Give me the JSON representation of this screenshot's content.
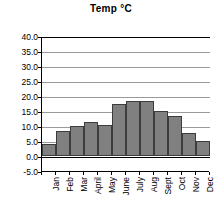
{
  "chart_data": {
    "type": "bar",
    "title": "Temp °C",
    "xlabel": "",
    "ylabel": "",
    "categories": [
      "Jan",
      "Feb",
      "Mar",
      "April",
      "May",
      "June",
      "July",
      "Aug",
      "Sept",
      "Oct",
      "Nov",
      "Dec"
    ],
    "values": [
      4.0,
      8.2,
      10.0,
      11.3,
      10.5,
      17.2,
      18.2,
      18.2,
      15.0,
      13.3,
      7.7,
      5.0
    ],
    "ylim": [
      -5.0,
      40.0
    ],
    "ytick_step": 5.0,
    "ytick_labels": [
      "40.0",
      "35.0",
      "30.0",
      "25.0",
      "20.0",
      "15.0",
      "10.0",
      "5.0",
      "0.0",
      "-5.0"
    ],
    "ytick_values": [
      40.0,
      35.0,
      30.0,
      25.0,
      20.0,
      15.0,
      10.0,
      5.0,
      0.0,
      -5.0
    ],
    "grid": true,
    "legend": false,
    "bar_color": "#808080",
    "bar_border_color": "#3d3d3d",
    "gridline_color": "#9a9a9a",
    "axis_color": "#000000",
    "background_color": "#ffffff",
    "xtick_rotation": -90
  }
}
